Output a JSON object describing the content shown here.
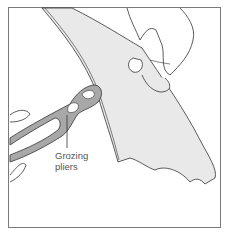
{
  "illustration": {
    "subject": "Hand holding glass piece while grozing pliers nibble its edge",
    "callout": {
      "line1": "Grozing",
      "line2": "pliers"
    },
    "colors": {
      "glass": "#e9e9e9",
      "pliers": "#a8a8a8",
      "outline": "#333333",
      "frame": "#7a7a7a"
    }
  }
}
